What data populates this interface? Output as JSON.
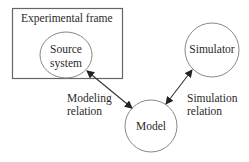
{
  "diagram": {
    "frame": {
      "label": "Experimental frame"
    },
    "nodes": [
      {
        "id": "source",
        "label_line1": "Source",
        "label_line2": "system"
      },
      {
        "id": "simulator",
        "label": "Simulator"
      },
      {
        "id": "model",
        "label": "Model"
      }
    ],
    "edges": [
      {
        "from": "source",
        "to": "model",
        "label_line1": "Modeling",
        "label_line2": "relation",
        "bidirectional": true
      },
      {
        "from": "simulator",
        "to": "model",
        "label_line1": "Simulation",
        "label_line2": "relation",
        "bidirectional": true
      }
    ],
    "colors": {
      "stroke": "#555555",
      "arrow": "#222222",
      "text": "#2a2a2a"
    }
  }
}
